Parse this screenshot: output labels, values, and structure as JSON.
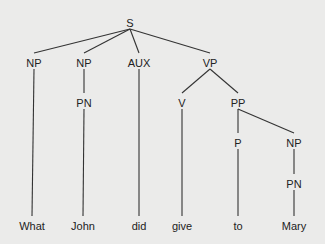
{
  "diagram": {
    "type": "syntax-tree",
    "background": "#ebebea",
    "line_color": "#333333",
    "nodes": [
      {
        "id": "S",
        "label": "S",
        "x": 130,
        "y": 23
      },
      {
        "id": "NP1",
        "label": "NP",
        "x": 34,
        "y": 63
      },
      {
        "id": "NP2",
        "label": "NP",
        "x": 84,
        "y": 63
      },
      {
        "id": "AUX",
        "label": "AUX",
        "x": 139,
        "y": 63
      },
      {
        "id": "VP",
        "label": "VP",
        "x": 210,
        "y": 63
      },
      {
        "id": "PN1",
        "label": "PN",
        "x": 84,
        "y": 103
      },
      {
        "id": "V",
        "label": "V",
        "x": 182,
        "y": 103
      },
      {
        "id": "PP",
        "label": "PP",
        "x": 238,
        "y": 103
      },
      {
        "id": "P",
        "label": "P",
        "x": 238,
        "y": 143
      },
      {
        "id": "NP3",
        "label": "NP",
        "x": 294,
        "y": 143
      },
      {
        "id": "PN2",
        "label": "PN",
        "x": 294,
        "y": 184
      },
      {
        "id": "W1",
        "label": "What",
        "x": 32,
        "y": 226
      },
      {
        "id": "W2",
        "label": "John",
        "x": 83,
        "y": 226
      },
      {
        "id": "W3",
        "label": "did",
        "x": 139,
        "y": 226
      },
      {
        "id": "W4",
        "label": "give",
        "x": 182,
        "y": 226
      },
      {
        "id": "W5",
        "label": "to",
        "x": 238,
        "y": 226
      },
      {
        "id": "W6",
        "label": "Mary",
        "x": 294,
        "y": 226
      }
    ],
    "edges": [
      [
        "S",
        "NP1"
      ],
      [
        "S",
        "NP2"
      ],
      [
        "S",
        "AUX"
      ],
      [
        "S",
        "VP"
      ],
      [
        "NP1",
        "W1"
      ],
      [
        "NP2",
        "PN1"
      ],
      [
        "PN1",
        "W2"
      ],
      [
        "AUX",
        "W3"
      ],
      [
        "VP",
        "V"
      ],
      [
        "VP",
        "PP"
      ],
      [
        "V",
        "W4"
      ],
      [
        "PP",
        "P"
      ],
      [
        "PP",
        "NP3"
      ],
      [
        "P",
        "W5"
      ],
      [
        "NP3",
        "PN2"
      ],
      [
        "PN2",
        "W6"
      ]
    ]
  }
}
